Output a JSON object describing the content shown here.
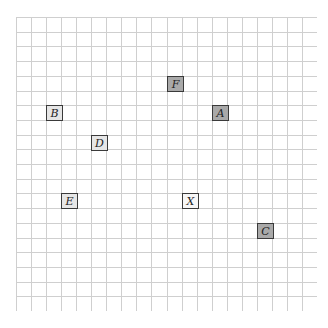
{
  "board": {
    "cols": 20,
    "rows": 20,
    "grid_color": "#cfcfcf",
    "tiles": [
      {
        "label": "F",
        "col": 10,
        "row": 4,
        "fill": "#a9a9a9"
      },
      {
        "label": "A",
        "col": 13,
        "row": 6,
        "fill": "#a9a9a9"
      },
      {
        "label": "B",
        "col": 2,
        "row": 6,
        "fill": "#e6e6e6"
      },
      {
        "label": "D",
        "col": 5,
        "row": 8,
        "fill": "#e6e6e6"
      },
      {
        "label": "E",
        "col": 3,
        "row": 12,
        "fill": "#e6e6e6"
      },
      {
        "label": "X",
        "col": 11,
        "row": 12,
        "fill": "#f7f7f7"
      },
      {
        "label": "C",
        "col": 16,
        "row": 14,
        "fill": "#a9a9a9"
      }
    ]
  }
}
